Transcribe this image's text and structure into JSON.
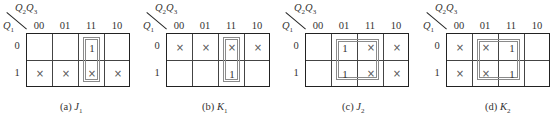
{
  "col_var_label": {
    "v1": "Q",
    "s1": "2",
    "v2": "Q",
    "s2": "3"
  },
  "row_var_label": {
    "v": "Q",
    "s": "1"
  },
  "col_headers": [
    "00",
    "01",
    "11",
    "10"
  ],
  "row_headers": [
    "0",
    "1"
  ],
  "maps": [
    {
      "id": "a",
      "caption_prefix": "(a) ",
      "caption_var": "J",
      "caption_sub": "1",
      "cells": [
        [
          "",
          "",
          "1",
          ""
        ],
        [
          "×",
          "×",
          "×",
          "×"
        ]
      ],
      "groups": [
        {
          "col_start": 2,
          "col_end": 2,
          "row_start": 0,
          "row_end": 1
        }
      ]
    },
    {
      "id": "b",
      "caption_prefix": "(b) ",
      "caption_var": "K",
      "caption_sub": "1",
      "cells": [
        [
          "×",
          "×",
          "×",
          "×"
        ],
        [
          "",
          "",
          "1",
          ""
        ]
      ],
      "groups": [
        {
          "col_start": 2,
          "col_end": 2,
          "row_start": 0,
          "row_end": 1
        }
      ]
    },
    {
      "id": "c",
      "caption_prefix": "(c) ",
      "caption_var": "J",
      "caption_sub": "2",
      "cells": [
        [
          "",
          "1",
          "×",
          "×"
        ],
        [
          "",
          "1",
          "×",
          "×"
        ]
      ],
      "groups": [
        {
          "col_start": 1,
          "col_end": 2,
          "row_start": 0,
          "row_end": 1
        }
      ]
    },
    {
      "id": "d",
      "caption_prefix": "(d) ",
      "caption_var": "K",
      "caption_sub": "2",
      "cells": [
        [
          "×",
          "×",
          "1",
          ""
        ],
        [
          "×",
          "×",
          "1",
          ""
        ]
      ],
      "groups": [
        {
          "col_start": 1,
          "col_end": 2,
          "row_start": 0,
          "row_end": 1
        }
      ]
    }
  ],
  "colors": {
    "grid": "#222222",
    "loop": "#8a8a8a",
    "text": "#333333"
  }
}
